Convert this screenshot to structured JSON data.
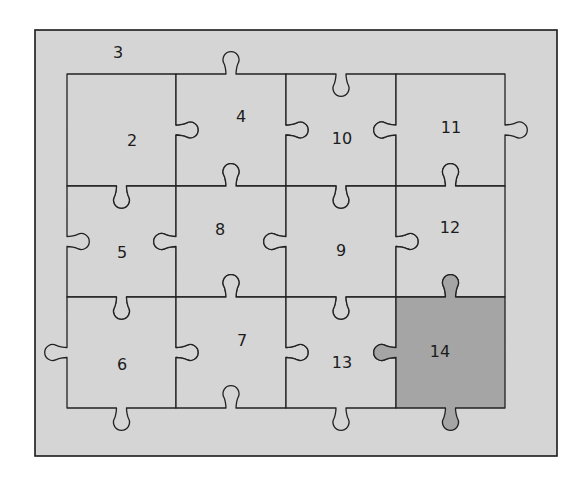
{
  "diagram": {
    "colors": {
      "background": "#d5d5d5",
      "piece_fill": "#d5d5d5",
      "highlight_fill": "#a5a5a5",
      "line": "#222222"
    },
    "frame": {
      "x": 35,
      "y": 30,
      "width": 522,
      "height": 426
    },
    "grid": {
      "cols_x": [
        67,
        176,
        286,
        396,
        505
      ],
      "rows_y": [
        74,
        186,
        297,
        408
      ]
    },
    "outside_label": {
      "text": "3",
      "x": 118,
      "y": 52
    },
    "pieces": [
      {
        "id": "2",
        "row": 0,
        "col": 0,
        "label_x": 132,
        "label_y": 140,
        "highlight": false,
        "edges": {
          "top": 0,
          "right": 1,
          "bottom": 1,
          "left": 0
        }
      },
      {
        "id": "4",
        "row": 0,
        "col": 1,
        "label_x": 241,
        "label_y": 116,
        "highlight": false,
        "edges": {
          "top": 1,
          "right": 1,
          "bottom": -1,
          "left": -1
        }
      },
      {
        "id": "10",
        "row": 0,
        "col": 2,
        "label_x": 342,
        "label_y": 138,
        "highlight": false,
        "edges": {
          "top": -1,
          "right": -1,
          "bottom": 1,
          "left": -1
        }
      },
      {
        "id": "11",
        "row": 0,
        "col": 3,
        "label_x": 451,
        "label_y": 127,
        "highlight": false,
        "edges": {
          "top": 0,
          "right": 1,
          "bottom": -1,
          "left": 1
        }
      },
      {
        "id": "5",
        "row": 1,
        "col": 0,
        "label_x": 122,
        "label_y": 252,
        "highlight": false,
        "edges": {
          "top": -1,
          "right": -1,
          "bottom": 1,
          "left": -1
        }
      },
      {
        "id": "8",
        "row": 1,
        "col": 1,
        "label_x": 220,
        "label_y": 229,
        "highlight": false,
        "edges": {
          "top": 1,
          "right": -1,
          "bottom": -1,
          "left": 1
        }
      },
      {
        "id": "9",
        "row": 1,
        "col": 2,
        "label_x": 341,
        "label_y": 250,
        "highlight": false,
        "edges": {
          "top": -1,
          "right": 1,
          "bottom": 1,
          "left": 1
        }
      },
      {
        "id": "12",
        "row": 1,
        "col": 3,
        "label_x": 450,
        "label_y": 227,
        "highlight": false,
        "edges": {
          "top": 1,
          "right": 0,
          "bottom": -1,
          "left": -1
        }
      },
      {
        "id": "6",
        "row": 2,
        "col": 0,
        "label_x": 122,
        "label_y": 364,
        "highlight": false,
        "edges": {
          "top": -1,
          "right": 1,
          "bottom": 1,
          "left": 1
        }
      },
      {
        "id": "7",
        "row": 2,
        "col": 1,
        "label_x": 242,
        "label_y": 340,
        "highlight": false,
        "edges": {
          "top": 1,
          "right": 1,
          "bottom": -1,
          "left": -1
        }
      },
      {
        "id": "13",
        "row": 2,
        "col": 2,
        "label_x": 342,
        "label_y": 362,
        "highlight": false,
        "edges": {
          "top": -1,
          "right": -1,
          "bottom": 1,
          "left": -1
        }
      },
      {
        "id": "14",
        "row": 2,
        "col": 3,
        "label_x": 440,
        "label_y": 351,
        "highlight": true,
        "edges": {
          "top": 1,
          "right": 0,
          "bottom": 1,
          "left": 1
        }
      }
    ],
    "tab_geometry": {
      "neck_half_width": 5,
      "head_radius": 8,
      "head_offset": 14
    }
  }
}
